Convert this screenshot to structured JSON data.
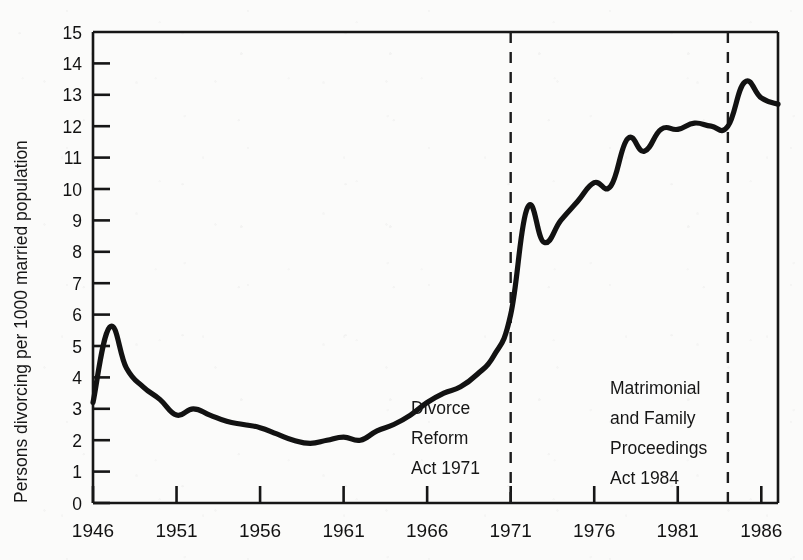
{
  "chart_data": {
    "type": "line",
    "title": "",
    "xlabel": "",
    "ylabel": "Persons divorcing per 1000 married population",
    "xlim": [
      1946,
      1987
    ],
    "ylim": [
      0,
      15
    ],
    "grid": false,
    "legend": "none",
    "y_ticks": [
      "0",
      "1",
      "2",
      "3",
      "4",
      "5",
      "6",
      "7",
      "8",
      "9",
      "10",
      "11",
      "12",
      "13",
      "14",
      "15"
    ],
    "x_ticks": [
      "1946",
      "1951",
      "1956",
      "1961",
      "1966",
      "1971",
      "1976",
      "1981",
      "1986"
    ],
    "x_tick_values": [
      1946,
      1951,
      1956,
      1961,
      1966,
      1971,
      1976,
      1981,
      1986
    ],
    "series": [
      {
        "name": "Persons divorcing per 1000 married population",
        "x": [
          1946,
          1947,
          1948,
          1949,
          1950,
          1951,
          1952,
          1953,
          1954,
          1955,
          1956,
          1957,
          1958,
          1959,
          1960,
          1961,
          1962,
          1963,
          1964,
          1965,
          1966,
          1967,
          1968,
          1969,
          1970,
          1971,
          1972,
          1973,
          1974,
          1975,
          1976,
          1977,
          1978,
          1979,
          1980,
          1981,
          1982,
          1983,
          1984,
          1985,
          1986,
          1987
        ],
        "values": [
          3.2,
          5.6,
          4.3,
          3.7,
          3.3,
          2.8,
          3.0,
          2.8,
          2.6,
          2.5,
          2.4,
          2.2,
          2.0,
          1.9,
          2.0,
          2.1,
          2.0,
          2.3,
          2.5,
          2.8,
          3.2,
          3.5,
          3.7,
          4.1,
          4.7,
          6.0,
          9.4,
          8.3,
          9.0,
          9.6,
          10.2,
          10.1,
          11.6,
          11.2,
          11.9,
          11.9,
          12.1,
          12.0,
          12.0,
          13.4,
          12.9,
          12.7
        ]
      }
    ],
    "annotations": [
      {
        "id": "divorce-reform-act-1971",
        "lines": [
          "Divorce",
          "Reform",
          "Act 1971"
        ],
        "marker_year": 1971,
        "marker_style": "dashed-vertical-line"
      },
      {
        "id": "matrimonial-and-family-proceedings-act-1984",
        "lines": [
          "Matrimonial",
          "and Family",
          "Proceedings",
          "Act 1984"
        ],
        "marker_year": 1984,
        "marker_style": "dashed-vertical-line"
      }
    ],
    "colors": {
      "line": "#121212",
      "axis": "#161616",
      "background": "#fbfbfa",
      "annotation_marker": "#1c1c1c"
    }
  }
}
